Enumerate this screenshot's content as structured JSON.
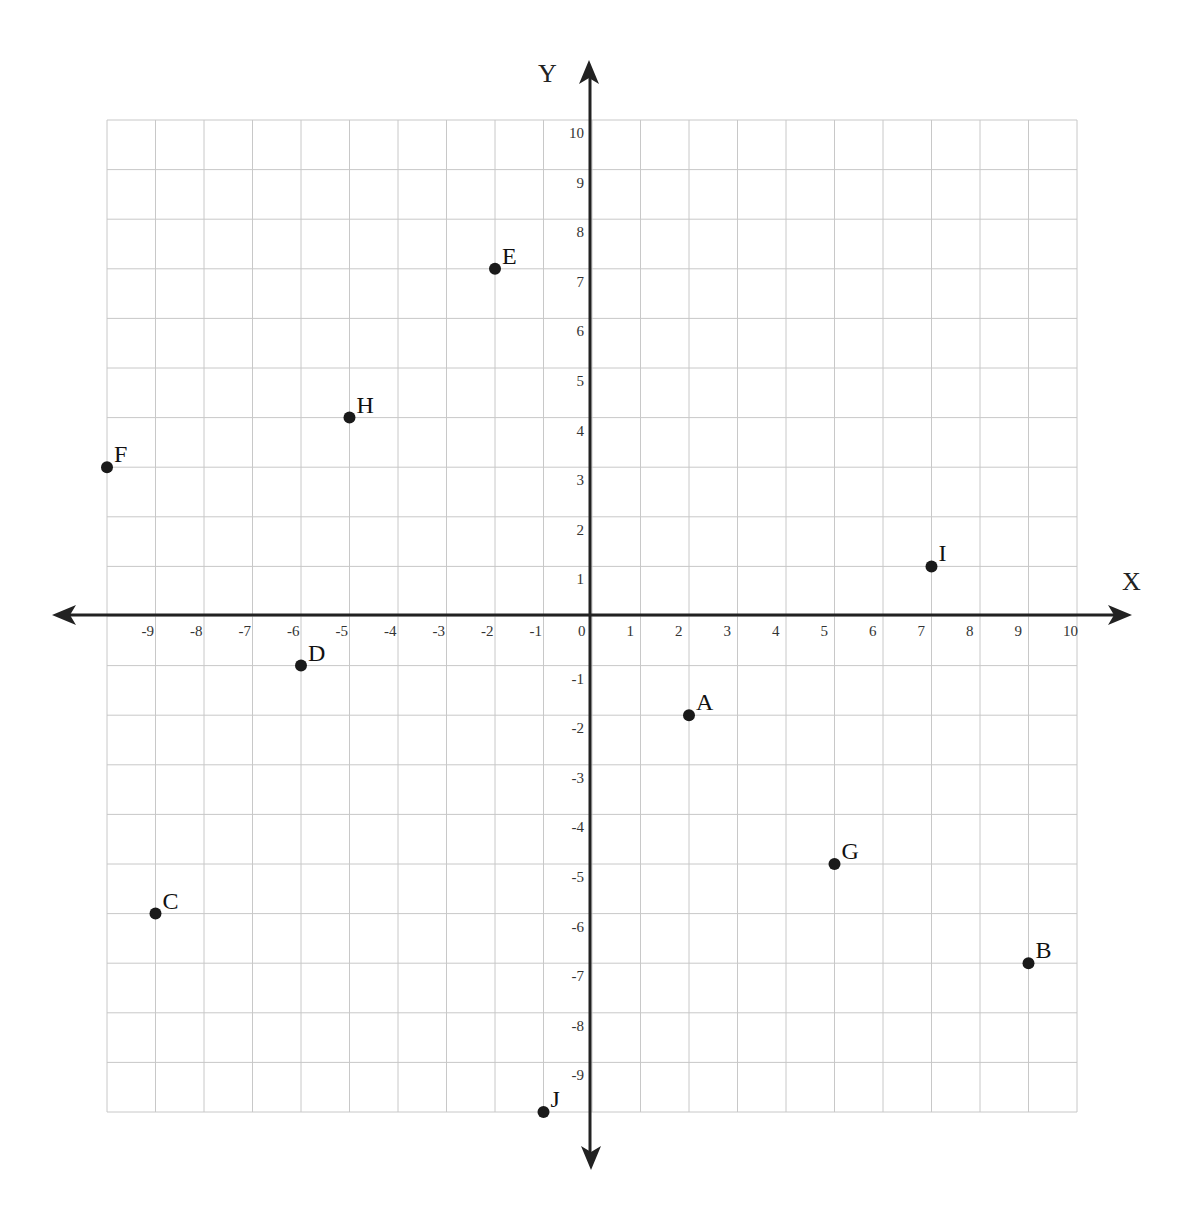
{
  "chart_data": {
    "type": "scatter",
    "title": "",
    "xlabel": "X",
    "ylabel": "Y",
    "xlim": [
      -10,
      10
    ],
    "ylim": [
      -10,
      10
    ],
    "grid": true,
    "legend": null,
    "x_ticks": [
      -9,
      -8,
      -7,
      -6,
      -5,
      -4,
      -3,
      -2,
      -1,
      0,
      1,
      2,
      3,
      4,
      5,
      6,
      7,
      8,
      9,
      10
    ],
    "y_ticks": [
      10,
      9,
      8,
      7,
      6,
      5,
      4,
      3,
      2,
      1,
      -1,
      -2,
      -3,
      -4,
      -5,
      -6,
      -7,
      -8,
      -9
    ],
    "points": [
      {
        "label": "A",
        "x": 2,
        "y": -2
      },
      {
        "label": "B",
        "x": 9,
        "y": -7
      },
      {
        "label": "C",
        "x": -9,
        "y": -6
      },
      {
        "label": "D",
        "x": -6,
        "y": -1
      },
      {
        "label": "E",
        "x": -2,
        "y": 7
      },
      {
        "label": "F",
        "x": -10,
        "y": 3
      },
      {
        "label": "G",
        "x": 5,
        "y": -5
      },
      {
        "label": "H",
        "x": -5,
        "y": 4
      },
      {
        "label": "I",
        "x": 7,
        "y": 1
      },
      {
        "label": "J",
        "x": -1,
        "y": -10
      }
    ]
  },
  "colors": {
    "grid": "#c8c8c8",
    "axis": "#222222",
    "point": "#1a1a1a"
  }
}
